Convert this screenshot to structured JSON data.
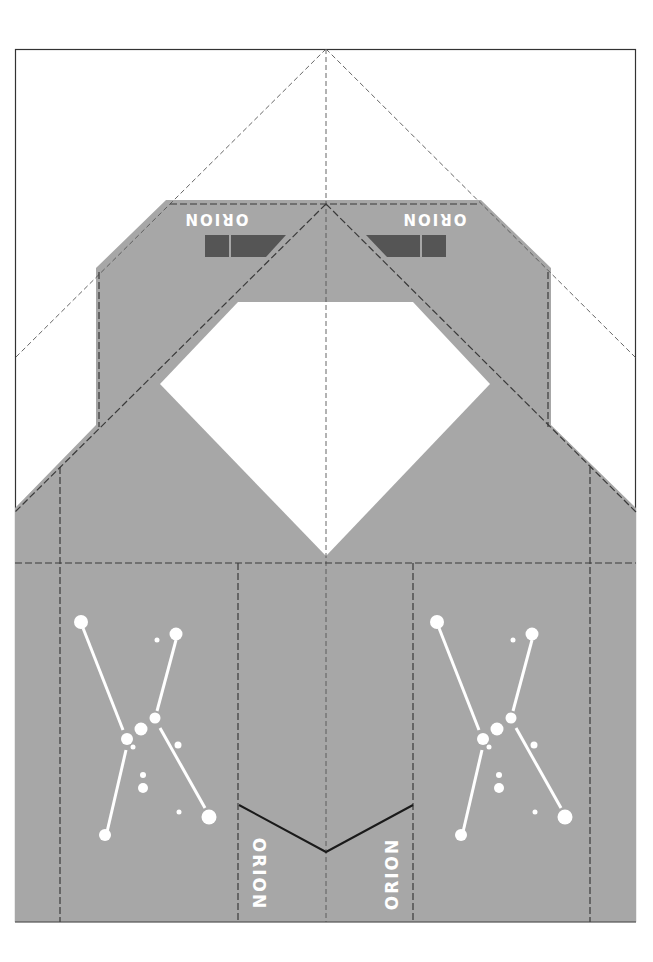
{
  "template": {
    "title": "Orion papercraft net",
    "colors": {
      "paper": "#ffffff",
      "panel": "#a7a7a7",
      "dark_block": "#555555",
      "fold_line": "#444444",
      "cut_line": "#222222",
      "star": "#ffffff"
    },
    "labels": {
      "top_left": "ORION",
      "top_right": "ORION",
      "bottom_left": "ORION",
      "bottom_right": "ORION"
    },
    "constellations": [
      {
        "name": "orion-left",
        "offset_x": 0
      },
      {
        "name": "orion-right",
        "offset_x": 356
      }
    ]
  }
}
